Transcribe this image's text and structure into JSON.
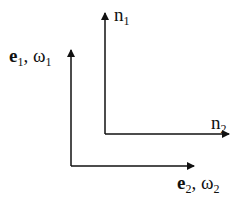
{
  "diagram": {
    "type": "coordinate-frames",
    "stroke_color": "#111111",
    "background": "#ffffff",
    "frames": [
      {
        "name": "e-frame",
        "origin": [
          71,
          166
        ],
        "vertical_tip": [
          71,
          50
        ],
        "horizontal_tip": [
          194,
          166
        ],
        "vertical_label": {
          "vec": "e",
          "sub1": "1",
          "sep": ", ",
          "sym": "ω",
          "sub2": "1"
        },
        "horizontal_label": {
          "vec": "e",
          "sub1": "2",
          "sep": ", ",
          "sym": "ω",
          "sub2": "2"
        }
      },
      {
        "name": "n-frame",
        "origin": [
          105,
          134
        ],
        "vertical_tip": [
          105,
          13
        ],
        "horizontal_tip": [
          229,
          134
        ],
        "vertical_label": {
          "sym": "n",
          "sub": "1"
        },
        "horizontal_label": {
          "sym": "n",
          "sub": "2"
        }
      }
    ]
  }
}
